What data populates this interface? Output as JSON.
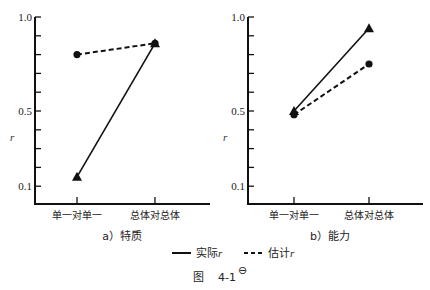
{
  "chart_data": [
    {
      "type": "line",
      "title": "a）特质",
      "xlabel": "",
      "ylabel": "r",
      "categories": [
        "单一对单一",
        "总体对总体"
      ],
      "ytick_labels": [
        "1.0",
        "0.5",
        "0.1"
      ],
      "ylim": [
        0.0,
        1.0
      ],
      "grid": false,
      "series": [
        {
          "name": "实际r",
          "style": "solid",
          "marker": "triangle",
          "values": [
            0.15,
            0.86
          ]
        },
        {
          "name": "估计r",
          "style": "dashed",
          "marker": "circle",
          "values": [
            0.8,
            0.86
          ]
        }
      ]
    },
    {
      "type": "line",
      "title": "b）能力",
      "xlabel": "",
      "ylabel": "r",
      "categories": [
        "单一对单一",
        "总体对总体"
      ],
      "ytick_labels": [
        "1.0",
        "0.5",
        "0.1"
      ],
      "ylim": [
        0.0,
        1.0
      ],
      "grid": false,
      "series": [
        {
          "name": "实际r",
          "style": "solid",
          "marker": "triangle",
          "values": [
            0.5,
            0.94
          ]
        },
        {
          "name": "估计r",
          "style": "dashed",
          "marker": "circle",
          "values": [
            0.48,
            0.75
          ]
        }
      ]
    }
  ],
  "legend": {
    "position": "bottom",
    "items": [
      {
        "label": "实际",
        "italic_suffix": "r",
        "style": "solid"
      },
      {
        "label": "估计",
        "italic_suffix": "r",
        "style": "dashed"
      }
    ]
  },
  "figure_caption": {
    "prefix": "图",
    "number": "4-1",
    "superscript": "⊖"
  }
}
